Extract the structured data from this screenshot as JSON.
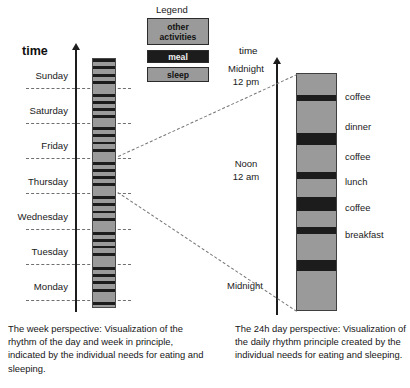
{
  "legend": {
    "title": "Legend",
    "items": [
      {
        "label": "other\nactivities",
        "label_line1": "other",
        "label_line2": "activities",
        "color": "#9a9a9a",
        "name": "other-activities"
      },
      {
        "label": "meal",
        "color": "#1c1c1c",
        "name": "meal"
      },
      {
        "label": "sleep",
        "color": "#9a9a9a",
        "name": "sleep"
      }
    ]
  },
  "week_chart": {
    "axis_title": "time",
    "day_labels": [
      "Sunday",
      "Saturday",
      "Friday",
      "Thursday",
      "Wednesday",
      "Tuesday",
      "Monday"
    ],
    "caption": "The week perspective: Visualization of the rhythm of the day and week in principle, indicated by the individual needs for eating and sleeping."
  },
  "day_chart": {
    "axis_title": "time",
    "top_label_line1": "Midnight",
    "top_label_line2": "12 pm",
    "mid_label_line1": "Noon",
    "mid_label_line2": "12 am",
    "bottom_label": "Midnight",
    "meal_labels": [
      "coffee",
      "dinner",
      "coffee",
      "lunch",
      "coffee",
      "breakfast"
    ],
    "caption": "The 24h day perspective: Visualization of the daily rhythm principle created by the individual needs for eating and sleeping."
  },
  "chart_data": {
    "type": "bar",
    "title": "Rhythm of the day and week",
    "orientation": "vertical-stacked",
    "colors": {
      "other_activities": "#9a9a9a",
      "meal": "#1c1c1c",
      "sleep": "#9a9a9a",
      "axis": "#1d1d1d",
      "dashed_guide": "#6f6f6f"
    },
    "charts": [
      {
        "name": "week-perspective",
        "type": "bar",
        "xlabel": "",
        "ylabel": "time",
        "categories": [
          "Monday",
          "Tuesday",
          "Wednesday",
          "Thursday",
          "Friday",
          "Saturday",
          "Sunday"
        ],
        "category_boundaries_pct": [
          0,
          14.3,
          28.6,
          42.9,
          57.1,
          71.4,
          85.7,
          100
        ],
        "description": "Seven stacked day-columns of alternating meal (dark) / other-activity (grey) bands, sleep block at each day end.",
        "segments_pct": [
          {
            "type": "meal",
            "start": 0.0,
            "end": 1.4
          },
          {
            "type": "other",
            "start": 1.4,
            "end": 3.0
          },
          {
            "type": "meal",
            "start": 3.0,
            "end": 4.2
          },
          {
            "type": "other",
            "start": 4.2,
            "end": 6.2
          },
          {
            "type": "meal",
            "start": 6.2,
            "end": 7.2
          },
          {
            "type": "other",
            "start": 7.2,
            "end": 9.0
          },
          {
            "type": "meal",
            "start": 9.0,
            "end": 10.2
          },
          {
            "type": "sleep",
            "start": 10.2,
            "end": 14.0
          },
          {
            "type": "meal",
            "start": 14.0,
            "end": 15.2
          },
          {
            "type": "other",
            "start": 15.2,
            "end": 17.0
          },
          {
            "type": "meal",
            "start": 17.0,
            "end": 18.0
          },
          {
            "type": "other",
            "start": 18.0,
            "end": 19.8
          },
          {
            "type": "meal",
            "start": 19.8,
            "end": 21.0
          },
          {
            "type": "other",
            "start": 21.0,
            "end": 22.6
          },
          {
            "type": "meal",
            "start": 22.6,
            "end": 23.8
          },
          {
            "type": "sleep",
            "start": 23.8,
            "end": 27.6
          },
          {
            "type": "meal",
            "start": 27.6,
            "end": 28.8
          },
          {
            "type": "other",
            "start": 28.8,
            "end": 30.4
          },
          {
            "type": "meal",
            "start": 30.4,
            "end": 31.6
          },
          {
            "type": "other",
            "start": 31.6,
            "end": 33.4
          },
          {
            "type": "meal",
            "start": 33.4,
            "end": 34.4
          },
          {
            "type": "other",
            "start": 34.4,
            "end": 36.2
          },
          {
            "type": "meal",
            "start": 36.2,
            "end": 37.4
          },
          {
            "type": "sleep",
            "start": 37.4,
            "end": 41.4
          },
          {
            "type": "meal",
            "start": 41.4,
            "end": 42.6
          },
          {
            "type": "other",
            "start": 42.6,
            "end": 44.2
          },
          {
            "type": "meal",
            "start": 44.2,
            "end": 45.4
          },
          {
            "type": "other",
            "start": 45.4,
            "end": 47.2
          },
          {
            "type": "meal",
            "start": 47.2,
            "end": 48.2
          },
          {
            "type": "other",
            "start": 48.2,
            "end": 50.0
          },
          {
            "type": "meal",
            "start": 50.0,
            "end": 51.2
          },
          {
            "type": "sleep",
            "start": 51.2,
            "end": 55.4
          },
          {
            "type": "meal",
            "start": 55.4,
            "end": 56.6
          },
          {
            "type": "other",
            "start": 56.6,
            "end": 58.2
          },
          {
            "type": "meal",
            "start": 58.2,
            "end": 59.4
          },
          {
            "type": "other",
            "start": 59.4,
            "end": 61.2
          },
          {
            "type": "meal",
            "start": 61.2,
            "end": 62.2
          },
          {
            "type": "other",
            "start": 62.2,
            "end": 64.2
          },
          {
            "type": "meal",
            "start": 64.2,
            "end": 65.4
          },
          {
            "type": "sleep",
            "start": 65.4,
            "end": 69.6
          },
          {
            "type": "meal",
            "start": 69.6,
            "end": 70.8
          },
          {
            "type": "other",
            "start": 70.8,
            "end": 72.4
          },
          {
            "type": "meal",
            "start": 72.4,
            "end": 73.6
          },
          {
            "type": "other",
            "start": 73.6,
            "end": 75.4
          },
          {
            "type": "meal",
            "start": 75.4,
            "end": 76.4
          },
          {
            "type": "other",
            "start": 76.4,
            "end": 78.4
          },
          {
            "type": "meal",
            "start": 78.4,
            "end": 79.6
          },
          {
            "type": "sleep",
            "start": 79.6,
            "end": 83.8
          },
          {
            "type": "meal",
            "start": 83.8,
            "end": 85.0
          },
          {
            "type": "other",
            "start": 85.0,
            "end": 86.6
          },
          {
            "type": "meal",
            "start": 86.6,
            "end": 87.8
          },
          {
            "type": "other",
            "start": 87.8,
            "end": 89.6
          },
          {
            "type": "meal",
            "start": 89.6,
            "end": 90.6
          },
          {
            "type": "other",
            "start": 90.6,
            "end": 92.6
          },
          {
            "type": "meal",
            "start": 92.6,
            "end": 93.8
          },
          {
            "type": "sleep",
            "start": 93.8,
            "end": 98.0
          },
          {
            "type": "meal",
            "start": 98.0,
            "end": 99.2
          },
          {
            "type": "other",
            "start": 99.2,
            "end": 100.0
          }
        ]
      },
      {
        "name": "day-perspective-24h",
        "type": "bar",
        "xlabel": "",
        "ylabel": "time",
        "axis_ticks": [
          "Midnight 12 pm",
          "Noon 12 am",
          "Midnight"
        ],
        "axis_tick_pct": [
          0,
          50,
          100
        ],
        "description": "Single 24h column: grey other-activity blocks separated by dark meal bands, long sleep block at the bottom (night).",
        "segments_pct": [
          {
            "type": "other",
            "label": "",
            "start": 0.0,
            "end": 9.0
          },
          {
            "type": "meal",
            "label": "coffee",
            "start": 9.0,
            "end": 11.5
          },
          {
            "type": "other",
            "label": "",
            "start": 11.5,
            "end": 25.0
          },
          {
            "type": "meal",
            "label": "dinner",
            "start": 25.0,
            "end": 30.0
          },
          {
            "type": "other",
            "label": "",
            "start": 30.0,
            "end": 41.5
          },
          {
            "type": "meal",
            "label": "coffee",
            "start": 41.5,
            "end": 44.5
          },
          {
            "type": "other",
            "label": "",
            "start": 44.5,
            "end": 52.0
          },
          {
            "type": "meal",
            "label": "lunch",
            "start": 52.0,
            "end": 58.0
          },
          {
            "type": "other",
            "label": "",
            "start": 58.0,
            "end": 65.0
          },
          {
            "type": "meal",
            "label": "coffee",
            "start": 65.0,
            "end": 68.0
          },
          {
            "type": "other",
            "label": "",
            "start": 68.0,
            "end": 79.0
          },
          {
            "type": "meal",
            "label": "breakfast",
            "start": 79.0,
            "end": 83.5
          },
          {
            "type": "sleep",
            "label": "",
            "start": 83.5,
            "end": 100.0
          }
        ]
      }
    ]
  }
}
